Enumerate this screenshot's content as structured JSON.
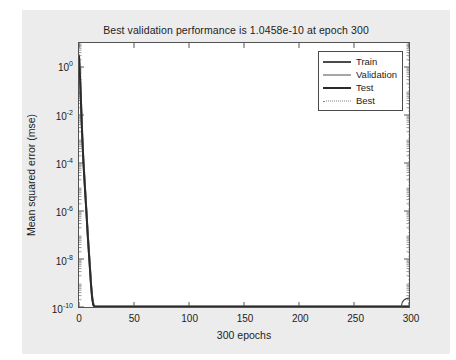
{
  "figure": {
    "background_color": "#ececec",
    "plot_background_color": "#ffffff",
    "axis_color": "#535353"
  },
  "chart_data": {
    "type": "line",
    "title": "Best validation performance is 1.0458e-10 at epoch 300",
    "xlabel": "300 epochs",
    "ylabel": "Mean squared error (mse)",
    "yscale": "log",
    "xlim": [
      0,
      300
    ],
    "ylim": [
      1e-10,
      10
    ],
    "grid": false,
    "legend_position": "top-right",
    "xticks": [
      0,
      50,
      100,
      150,
      200,
      250,
      300
    ],
    "xtick_labels": [
      "0",
      "50",
      "100",
      "150",
      "200",
      "250",
      "300"
    ],
    "yticks": [
      1,
      0.01,
      0.0001,
      1e-06,
      1e-08,
      1e-10
    ],
    "ytick_labels": [
      "10^0",
      "10^-2",
      "10^-4",
      "10^-6",
      "10^-8",
      "10^-10"
    ],
    "ytick_mantissa": [
      "10",
      "10",
      "10",
      "10",
      "10",
      "10"
    ],
    "ytick_exponent": [
      "0",
      "-2",
      "-4",
      "-6",
      "-8",
      "-10"
    ],
    "best_epoch": 300,
    "best_value": "1.0458e-10",
    "annotations": [
      {
        "name": "best-marker-circle",
        "x": 300,
        "y": 1.0458e-10
      },
      {
        "name": "best-vertical-dotted-line",
        "x": 300
      }
    ],
    "series": [
      {
        "name": "Train",
        "color": "#4a4a4a",
        "style": "solid",
        "width": 2,
        "x": [
          0,
          1,
          2,
          3,
          4,
          5,
          6,
          7,
          8,
          9,
          10,
          11,
          12,
          13,
          14,
          16,
          20,
          30,
          50,
          75,
          100,
          150,
          200,
          250,
          300
        ],
        "y": [
          3.0,
          0.35,
          0.02,
          0.0012,
          0.00012,
          2e-05,
          3.5e-06,
          6e-07,
          1e-07,
          2e-08,
          4e-09,
          8e-10,
          2.5e-10,
          1.3e-10,
          1.08e-10,
          1.04e-10,
          1.04e-10,
          1.04e-10,
          1.04e-10,
          1.04e-10,
          1.04e-10,
          1.04e-10,
          1.04e-10,
          1.04e-10,
          1.04e-10
        ]
      },
      {
        "name": "Validation",
        "color": "#9a9a9a",
        "style": "solid",
        "width": 1.5,
        "x": [
          0,
          1,
          2,
          3,
          4,
          5,
          6,
          7,
          8,
          9,
          10,
          11,
          12,
          13,
          14,
          16,
          20,
          30,
          50,
          75,
          100,
          150,
          200,
          250,
          300
        ],
        "y": [
          3.2,
          0.4,
          0.025,
          0.0015,
          0.00015,
          2.5e-05,
          4e-06,
          7e-07,
          1.2e-07,
          2.4e-08,
          4.8e-09,
          9.5e-10,
          3e-10,
          1.5e-10,
          1.1e-10,
          1.05e-10,
          1.05e-10,
          1.05e-10,
          1.05e-10,
          1.05e-10,
          1.05e-10,
          1.05e-10,
          1.05e-10,
          1.05e-10,
          1.05e-10
        ]
      },
      {
        "name": "Test",
        "color": "#2b2b2b",
        "style": "solid",
        "width": 2,
        "x": [
          0,
          1,
          2,
          3,
          4,
          5,
          6,
          7,
          8,
          9,
          10,
          11,
          12,
          13,
          14,
          16,
          20,
          30,
          50,
          75,
          100,
          150,
          200,
          250,
          300
        ],
        "y": [
          2.8,
          0.33,
          0.018,
          0.0011,
          0.00011,
          1.8e-05,
          3.2e-06,
          5.5e-07,
          9e-08,
          1.8e-08,
          3.6e-09,
          7.5e-10,
          2.3e-10,
          1.2e-10,
          1.06e-10,
          1.03e-10,
          1.03e-10,
          1.03e-10,
          1.03e-10,
          1.03e-10,
          1.03e-10,
          1.03e-10,
          1.03e-10,
          1.03e-10,
          1.03e-10
        ]
      },
      {
        "name": "Best",
        "color": "#8a8a8a",
        "style": "dotted",
        "width": 1
      }
    ]
  },
  "legend": {
    "items": [
      {
        "label": "Train"
      },
      {
        "label": "Validation"
      },
      {
        "label": "Test"
      },
      {
        "label": "Best"
      }
    ]
  }
}
